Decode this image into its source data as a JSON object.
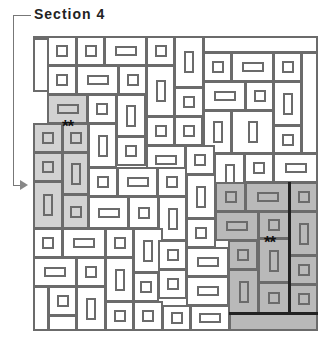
{
  "title": "Section 4",
  "markers": [
    {
      "text": "**",
      "x": 62,
      "y": 118
    },
    {
      "text": "**",
      "x": 264,
      "y": 234
    }
  ],
  "colors": {
    "line": "#6b6b6b",
    "shade_light": "#d2d2d2",
    "shade_dark": "#b9b9b9"
  },
  "cells": [
    {
      "x": 33,
      "y": 36,
      "w": 16,
      "h": 56,
      "s": ""
    },
    {
      "x": 33,
      "y": 36,
      "w": 268,
      "h": 2,
      "s": ""
    },
    {
      "x": 47,
      "y": 36,
      "w": 30,
      "h": 30,
      "s": "",
      "i": "sq"
    },
    {
      "x": 76,
      "y": 36,
      "w": 29,
      "h": 30,
      "s": "",
      "i": "sq"
    },
    {
      "x": 104,
      "y": 36,
      "w": 43,
      "h": 30,
      "s": "",
      "i": "wide"
    },
    {
      "x": 146,
      "y": 36,
      "w": 29,
      "h": 30,
      "s": "",
      "i": "sq"
    },
    {
      "x": 174,
      "y": 36,
      "w": 30,
      "h": 52,
      "s": "",
      "i": "tall"
    },
    {
      "x": 203,
      "y": 36,
      "w": 115,
      "h": 17,
      "s": ""
    },
    {
      "x": 47,
      "y": 65,
      "w": 30,
      "h": 30,
      "s": "",
      "i": "sq"
    },
    {
      "x": 76,
      "y": 65,
      "w": 43,
      "h": 30,
      "s": "",
      "i": "wide"
    },
    {
      "x": 118,
      "y": 65,
      "w": 29,
      "h": 30,
      "s": "",
      "i": "sq"
    },
    {
      "x": 146,
      "y": 65,
      "w": 29,
      "h": 52,
      "s": "",
      "i": "tall"
    },
    {
      "x": 203,
      "y": 52,
      "w": 29,
      "h": 30,
      "s": "",
      "i": "sq"
    },
    {
      "x": 231,
      "y": 52,
      "w": 43,
      "h": 30,
      "s": "",
      "i": "wide"
    },
    {
      "x": 273,
      "y": 52,
      "w": 29,
      "h": 30,
      "s": "",
      "i": "sq"
    },
    {
      "x": 301,
      "y": 52,
      "w": 17,
      "h": 102,
      "s": ""
    },
    {
      "x": 174,
      "y": 87,
      "w": 30,
      "h": 30,
      "s": "",
      "i": "sq"
    },
    {
      "x": 203,
      "y": 81,
      "w": 43,
      "h": 30,
      "s": "",
      "i": "wide"
    },
    {
      "x": 245,
      "y": 81,
      "w": 29,
      "h": 30,
      "s": "",
      "i": "sq"
    },
    {
      "x": 273,
      "y": 81,
      "w": 29,
      "h": 45,
      "s": "",
      "i": "tall"
    },
    {
      "x": 47,
      "y": 94,
      "w": 41,
      "h": 30,
      "s": "shaded",
      "i": "wide"
    },
    {
      "x": 87,
      "y": 94,
      "w": 30,
      "h": 30,
      "s": "",
      "i": "sq"
    },
    {
      "x": 116,
      "y": 94,
      "w": 30,
      "h": 43,
      "s": "",
      "i": "tall"
    },
    {
      "x": 146,
      "y": 116,
      "w": 29,
      "h": 30,
      "s": "",
      "i": "sq"
    },
    {
      "x": 174,
      "y": 116,
      "w": 29,
      "h": 30,
      "s": "",
      "i": "sq"
    },
    {
      "x": 203,
      "y": 110,
      "w": 29,
      "h": 44,
      "s": "",
      "i": "tall"
    },
    {
      "x": 231,
      "y": 110,
      "w": 43,
      "h": 44,
      "s": "",
      "i": "tall"
    },
    {
      "x": 273,
      "y": 125,
      "w": 29,
      "h": 29,
      "s": "",
      "i": "sq"
    },
    {
      "x": 33,
      "y": 123,
      "w": 30,
      "h": 30,
      "s": "shaded",
      "i": "sq"
    },
    {
      "x": 62,
      "y": 123,
      "w": 27,
      "h": 30,
      "s": "shaded",
      "i": "sq"
    },
    {
      "x": 88,
      "y": 123,
      "w": 29,
      "h": 45,
      "s": "",
      "i": "tall"
    },
    {
      "x": 116,
      "y": 136,
      "w": 30,
      "h": 30,
      "s": "",
      "i": "sq"
    },
    {
      "x": 146,
      "y": 145,
      "w": 40,
      "h": 30,
      "s": "",
      "i": "wide"
    },
    {
      "x": 185,
      "y": 145,
      "w": 30,
      "h": 30,
      "s": "",
      "i": "sq"
    },
    {
      "x": 214,
      "y": 153,
      "w": 31,
      "h": 44,
      "s": "",
      "i": "tall"
    },
    {
      "x": 244,
      "y": 153,
      "w": 30,
      "h": 30,
      "s": "",
      "i": "sq"
    },
    {
      "x": 273,
      "y": 153,
      "w": 45,
      "h": 30,
      "s": "",
      "i": "wide"
    },
    {
      "x": 33,
      "y": 152,
      "w": 30,
      "h": 30,
      "s": "shaded",
      "i": "sq"
    },
    {
      "x": 62,
      "y": 152,
      "w": 27,
      "h": 43,
      "s": "shaded",
      "i": "tall"
    },
    {
      "x": 88,
      "y": 167,
      "w": 30,
      "h": 30,
      "s": "",
      "i": "sq"
    },
    {
      "x": 117,
      "y": 167,
      "w": 41,
      "h": 30,
      "s": "",
      "i": "wide"
    },
    {
      "x": 157,
      "y": 167,
      "w": 30,
      "h": 30,
      "s": "",
      "i": "sq"
    },
    {
      "x": 186,
      "y": 174,
      "w": 30,
      "h": 45,
      "s": "",
      "i": "tall"
    },
    {
      "x": 33,
      "y": 181,
      "w": 30,
      "h": 48,
      "s": "shaded",
      "i": "tall"
    },
    {
      "x": 62,
      "y": 194,
      "w": 27,
      "h": 35,
      "s": "shaded",
      "i": "sq"
    },
    {
      "x": 88,
      "y": 196,
      "w": 41,
      "h": 33,
      "s": "",
      "i": "wide"
    },
    {
      "x": 128,
      "y": 196,
      "w": 31,
      "h": 33,
      "s": "",
      "i": "sq"
    },
    {
      "x": 158,
      "y": 196,
      "w": 29,
      "h": 45,
      "s": "",
      "i": "tall"
    },
    {
      "x": 215,
      "y": 182,
      "w": 31,
      "h": 30,
      "s": "dark",
      "i": "sq"
    },
    {
      "x": 245,
      "y": 182,
      "w": 45,
      "h": 30,
      "s": "dark",
      "i": "wide"
    },
    {
      "x": 289,
      "y": 182,
      "w": 29,
      "h": 30,
      "s": "dark",
      "i": "sq"
    },
    {
      "x": 186,
      "y": 218,
      "w": 30,
      "h": 30,
      "s": "",
      "i": "sq"
    },
    {
      "x": 215,
      "y": 211,
      "w": 44,
      "h": 30,
      "s": "dark",
      "i": "wide"
    },
    {
      "x": 258,
      "y": 211,
      "w": 32,
      "h": 28,
      "s": "dark",
      "i": "sq"
    },
    {
      "x": 289,
      "y": 211,
      "w": 29,
      "h": 45,
      "s": "dark",
      "i": "tall"
    },
    {
      "x": 33,
      "y": 228,
      "w": 30,
      "h": 30,
      "s": "",
      "i": "sq"
    },
    {
      "x": 62,
      "y": 228,
      "w": 44,
      "h": 30,
      "s": "",
      "i": "wide"
    },
    {
      "x": 105,
      "y": 228,
      "w": 29,
      "h": 30,
      "s": "",
      "i": "sq"
    },
    {
      "x": 133,
      "y": 228,
      "w": 30,
      "h": 45,
      "s": "",
      "i": "tall"
    },
    {
      "x": 158,
      "y": 240,
      "w": 29,
      "h": 30,
      "s": "",
      "i": "sq"
    },
    {
      "x": 186,
      "y": 247,
      "w": 43,
      "h": 30,
      "s": "",
      "i": "wide"
    },
    {
      "x": 228,
      "y": 240,
      "w": 30,
      "h": 30,
      "s": "dark",
      "i": "sq"
    },
    {
      "x": 258,
      "y": 238,
      "w": 32,
      "h": 45,
      "s": "dark",
      "i": "tall"
    },
    {
      "x": 33,
      "y": 257,
      "w": 44,
      "h": 30,
      "s": "",
      "i": "wide"
    },
    {
      "x": 76,
      "y": 257,
      "w": 30,
      "h": 30,
      "s": "",
      "i": "sq"
    },
    {
      "x": 105,
      "y": 257,
      "w": 29,
      "h": 45,
      "s": "",
      "i": "tall"
    },
    {
      "x": 133,
      "y": 272,
      "w": 26,
      "h": 30,
      "s": "",
      "i": "sq"
    },
    {
      "x": 158,
      "y": 269,
      "w": 29,
      "h": 30,
      "s": "",
      "i": "sq"
    },
    {
      "x": 186,
      "y": 276,
      "w": 43,
      "h": 30,
      "s": "",
      "i": "wide"
    },
    {
      "x": 228,
      "y": 269,
      "w": 31,
      "h": 45,
      "s": "dark",
      "i": "tall"
    },
    {
      "x": 289,
      "y": 255,
      "w": 29,
      "h": 30,
      "s": "dark",
      "i": "sq"
    },
    {
      "x": 33,
      "y": 286,
      "w": 16,
      "h": 45,
      "s": ""
    },
    {
      "x": 48,
      "y": 286,
      "w": 29,
      "h": 30,
      "s": "",
      "i": "sq"
    },
    {
      "x": 48,
      "y": 315,
      "w": 29,
      "h": 16,
      "s": ""
    },
    {
      "x": 76,
      "y": 286,
      "w": 30,
      "h": 45,
      "s": "",
      "i": "tall"
    },
    {
      "x": 105,
      "y": 301,
      "w": 29,
      "h": 30,
      "s": "",
      "i": "sq"
    },
    {
      "x": 133,
      "y": 301,
      "w": 30,
      "h": 30,
      "s": "",
      "i": "sq"
    },
    {
      "x": 162,
      "y": 305,
      "w": 29,
      "h": 26,
      "s": "",
      "i": "sq"
    },
    {
      "x": 190,
      "y": 305,
      "w": 40,
      "h": 26,
      "s": "",
      "i": "wide"
    },
    {
      "x": 258,
      "y": 282,
      "w": 32,
      "h": 32,
      "s": "dark",
      "i": "sq"
    },
    {
      "x": 289,
      "y": 284,
      "w": 29,
      "h": 30,
      "s": "dark",
      "i": "sq"
    },
    {
      "x": 229,
      "y": 313,
      "w": 89,
      "h": 18,
      "s": "dark"
    }
  ],
  "thick_lines": [
    {
      "x": 288,
      "y": 182,
      "w": 3,
      "h": 132
    },
    {
      "x": 229,
      "y": 312,
      "w": 89,
      "h": 3
    }
  ]
}
